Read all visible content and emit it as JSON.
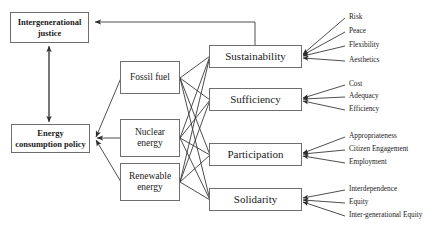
{
  "diagram": {
    "type": "flow-diagram",
    "background_color": "#ffffff",
    "line_color": "#3a3a3a",
    "box_border_color": "#6e6e6e",
    "nodes": {
      "intergenerational_justice": "Intergenerational\njustice",
      "energy_consumption_policy": "Energy\nconsumption policy",
      "fossil_fuel": "Fossil fuel",
      "nuclear_energy": "Nuclear\nenergy",
      "renewable_energy": "Renewable\nenergy",
      "sustainability": "Sustainability",
      "sufficiency": "Sufficiency",
      "participation": "Participation",
      "solidarity": "Solidarity"
    },
    "criteria": [
      {
        "group": "Sustainability",
        "items": [
          "Risk",
          "Peace",
          "Flexibility",
          "Aesthetics"
        ]
      },
      {
        "group": "Sufficiency",
        "items": [
          "Cost",
          "Adequacy",
          "Efficiency"
        ]
      },
      {
        "group": "Participation",
        "items": [
          "Appropriateness",
          "Citizen Engagement",
          "Employment"
        ]
      },
      {
        "group": "Solidarity",
        "items": [
          "Interdependence",
          "Equity",
          "Inter-generational Equity"
        ]
      }
    ],
    "leaf_labels": {
      "risk": "Risk",
      "peace": "Peace",
      "flexibility": "Flexibility",
      "aesthetics": "Aesthetics",
      "cost": "Cost",
      "adequacy": "Adequacy",
      "efficiency": "Efficiency",
      "appropriateness": "Appropriateness",
      "citizen_engagement": "Citizen Engagement",
      "employment": "Employment",
      "interdependence": "Interdependence",
      "equity": "Equity",
      "intergenerational_equity": "Inter-generational Equity"
    }
  }
}
